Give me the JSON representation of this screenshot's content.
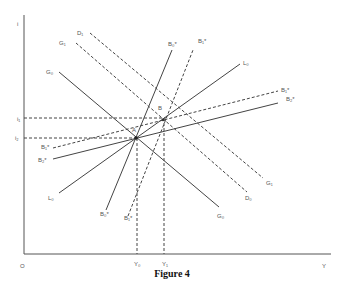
{
  "caption": "Figure 4",
  "axes": {
    "y_label": "i",
    "x_label": "Y",
    "origin_label": "O",
    "y_ticks": [
      {
        "label": "i₁",
        "y": 118
      },
      {
        "label": "i₂",
        "y": 138
      }
    ],
    "x_ticks": [
      {
        "label": "Y₀",
        "x": 137
      },
      {
        "label": "Y₁",
        "x": 164
      }
    ]
  },
  "points": [
    {
      "label": "A",
      "x": 136,
      "y": 138
    },
    {
      "label": "B",
      "x": 163,
      "y": 120
    }
  ],
  "curves": [
    {
      "label": "G₀",
      "style": "solid",
      "x1": 59,
      "y1": 72,
      "x2": 219,
      "y2": 207
    },
    {
      "label": "G₁",
      "style": "dashed",
      "x1": 76,
      "y1": 43,
      "x2": 247,
      "y2": 192
    },
    {
      "label": "D₁",
      "style": "dashed",
      "x1": 90,
      "y1": 33,
      "x2": 263,
      "y2": 178
    },
    {
      "label": "L₀",
      "style": "solid",
      "x1": 59,
      "y1": 193,
      "x2": 240,
      "y2": 64
    },
    {
      "label": "B₀*",
      "style": "solid",
      "x1": 106,
      "y1": 210,
      "x2": 172,
      "y2": 50
    },
    {
      "label": "B₁*",
      "style": "dashed",
      "x1": 128,
      "y1": 216,
      "x2": 193,
      "y2": 50
    },
    {
      "label": "B₂*",
      "style": "solid",
      "x1": 53,
      "y1": 159,
      "x2": 278,
      "y2": 103
    },
    {
      "label": "B₁*'",
      "style": "dashed",
      "x1": 53,
      "y1": 148,
      "x2": 278,
      "y2": 91
    }
  ],
  "labels": [
    {
      "text": "i",
      "x": 17,
      "y": 21
    },
    {
      "text": "i₁",
      "x": 17,
      "y": 116
    },
    {
      "text": "i₂",
      "x": 15,
      "y": 135
    },
    {
      "text": "D₁",
      "x": 77,
      "y": 30
    },
    {
      "text": "G₁",
      "x": 59,
      "y": 40
    },
    {
      "text": "G₀",
      "x": 46,
      "y": 69
    },
    {
      "text": "B₀*",
      "x": 168,
      "y": 41
    },
    {
      "text": "B₁*",
      "x": 198,
      "y": 38
    },
    {
      "text": "L₀",
      "x": 243,
      "y": 60
    },
    {
      "text": "B₁*",
      "x": 281,
      "y": 87
    },
    {
      "text": "B₂*",
      "x": 286,
      "y": 96
    },
    {
      "text": "B",
      "x": 158,
      "y": 105
    },
    {
      "text": "A",
      "x": 132,
      "y": 127
    },
    {
      "text": "B₁*",
      "x": 41,
      "y": 144
    },
    {
      "text": "B₂*",
      "x": 38,
      "y": 157
    },
    {
      "text": "L₀",
      "x": 48,
      "y": 195
    },
    {
      "text": "B₀*",
      "x": 100,
      "y": 211
    },
    {
      "text": "B₁*",
      "x": 124,
      "y": 215
    },
    {
      "text": "G₁",
      "x": 266,
      "y": 180
    },
    {
      "text": "D₀",
      "x": 245,
      "y": 195
    },
    {
      "text": "G₀",
      "x": 217,
      "y": 213
    },
    {
      "text": "O",
      "x": 20,
      "y": 263
    },
    {
      "text": "Y₀",
      "x": 134,
      "y": 261
    },
    {
      "text": "Y₁",
      "x": 162,
      "y": 261
    },
    {
      "text": "Y",
      "x": 322,
      "y": 263
    }
  ],
  "colors": {
    "line": "#444444",
    "axis": "#555555",
    "text": "#555555"
  }
}
